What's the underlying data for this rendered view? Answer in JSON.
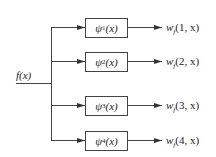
{
  "diagram": {
    "type": "filter-bank",
    "input": {
      "label": "f(x)"
    },
    "colors": {
      "line": "#444444",
      "text": "#222222",
      "background": "#ffffff"
    },
    "branches": [
      {
        "filter_symbol": "ψ",
        "filter_index": "1",
        "filter_arg": "(x)",
        "output_symbol": "w",
        "output_sub": "f",
        "output_args": "(1, x)"
      },
      {
        "filter_symbol": "ψ",
        "filter_index": "2",
        "filter_arg": "(x)",
        "output_symbol": "w",
        "output_sub": "f",
        "output_args": "(2, x)"
      },
      {
        "filter_symbol": "ψ",
        "filter_index": "3",
        "filter_arg": "(x)",
        "output_symbol": "w",
        "output_sub": "f",
        "output_args": "(3, x)"
      },
      {
        "filter_symbol": "ψ",
        "filter_index": "4",
        "filter_arg": "(x)",
        "output_symbol": "w",
        "output_sub": "f",
        "output_args": "(4, x)"
      }
    ]
  }
}
